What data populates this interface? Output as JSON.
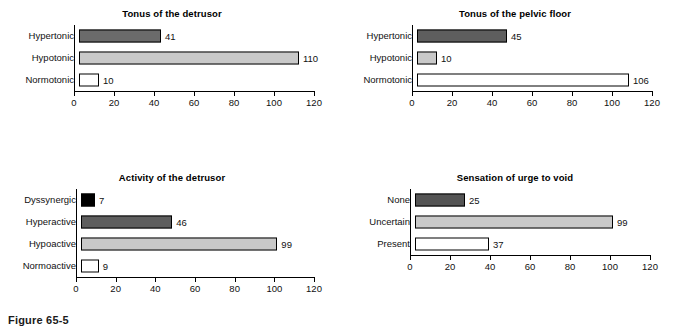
{
  "figure": {
    "caption": "Figure 65-5"
  },
  "chart_data": [
    {
      "type": "bar",
      "orientation": "horizontal",
      "title": "Tonus of the detrusor",
      "categories": [
        "Hypertonic",
        "Hypotonic",
        "Normotonic"
      ],
      "values": [
        41,
        110,
        10
      ],
      "bar_colors": [
        "#6b6b6b",
        "#c9c9c9",
        "#ffffff"
      ],
      "xlabel": "",
      "ylabel": "",
      "xlim": [
        0,
        120
      ],
      "xticks": [
        0,
        20,
        40,
        60,
        80,
        100,
        120
      ],
      "grid": false,
      "legend": "none"
    },
    {
      "type": "bar",
      "orientation": "horizontal",
      "title": "Tonus of the pelvic floor",
      "categories": [
        "Hypertonic",
        "Hypotonic",
        "Normotonic"
      ],
      "values": [
        45,
        10,
        106
      ],
      "bar_colors": [
        "#5e5e5e",
        "#c9c9c9",
        "#ffffff"
      ],
      "xlabel": "",
      "ylabel": "",
      "xlim": [
        0,
        120
      ],
      "xticks": [
        0,
        20,
        40,
        60,
        80,
        100,
        120
      ],
      "grid": false,
      "legend": "none"
    },
    {
      "type": "bar",
      "orientation": "horizontal",
      "title": "Activity of the detrusor",
      "categories": [
        "Dyssynergic",
        "Hyperactive",
        "Hypoactive",
        "Normoactive"
      ],
      "values": [
        7,
        46,
        99,
        9
      ],
      "bar_colors": [
        "#000000",
        "#5e5e5e",
        "#c9c9c9",
        "#ffffff"
      ],
      "xlabel": "",
      "ylabel": "",
      "xlim": [
        0,
        120
      ],
      "xticks": [
        0,
        20,
        40,
        60,
        80,
        100,
        120
      ],
      "grid": false,
      "legend": "none"
    },
    {
      "type": "bar",
      "orientation": "horizontal",
      "title": "Sensation of urge to void",
      "categories": [
        "None",
        "Uncertain",
        "Present"
      ],
      "values": [
        25,
        99,
        37
      ],
      "bar_colors": [
        "#545454",
        "#c9c9c9",
        "#ffffff"
      ],
      "xlabel": "",
      "ylabel": "",
      "xlim": [
        0,
        120
      ],
      "xticks": [
        0,
        20,
        40,
        60,
        80,
        100,
        120
      ],
      "grid": false,
      "legend": "none"
    }
  ]
}
